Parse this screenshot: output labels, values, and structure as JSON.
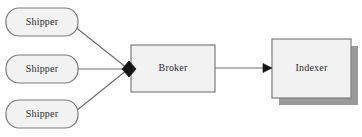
{
  "diagram": {
    "background_color": "#ffffff",
    "node_fill": "#f2f2f2",
    "node_stroke": "#7d7d7d",
    "shadow_color": "#9a9a9a",
    "line_color": "#6e6e6e",
    "text_color": "#2b2b2b",
    "nodes": [
      {
        "id": "shipper-1",
        "label": "Shipper",
        "shape": "rounded-rectangle",
        "x": 6,
        "y": 8,
        "width": 72,
        "height": 28
      },
      {
        "id": "shipper-2",
        "label": "Shipper",
        "shape": "rounded-rectangle",
        "x": 6,
        "y": 55,
        "width": 72,
        "height": 28
      },
      {
        "id": "shipper-3",
        "label": "Shipper",
        "shape": "rounded-rectangle",
        "x": 6,
        "y": 100,
        "width": 72,
        "height": 28
      },
      {
        "id": "broker",
        "label": "Broker",
        "shape": "rectangle",
        "x": 131,
        "y": 45,
        "width": 84,
        "height": 47
      },
      {
        "id": "indexer",
        "label": "Indexer",
        "shape": "rectangle-shadow",
        "x": 272,
        "y": 39,
        "width": 79,
        "height": 59
      }
    ],
    "edges": [
      {
        "id": "edge-shipper1-broker",
        "from": "shipper-1",
        "to": "broker",
        "endpoint": "diamond-junction"
      },
      {
        "id": "edge-shipper2-broker",
        "from": "shipper-2",
        "to": "broker",
        "endpoint": "diamond-junction"
      },
      {
        "id": "edge-shipper3-broker",
        "from": "shipper-3",
        "to": "broker",
        "endpoint": "diamond-junction"
      },
      {
        "id": "edge-broker-indexer",
        "from": "broker",
        "to": "indexer",
        "endpoint": "arrowhead"
      }
    ]
  }
}
